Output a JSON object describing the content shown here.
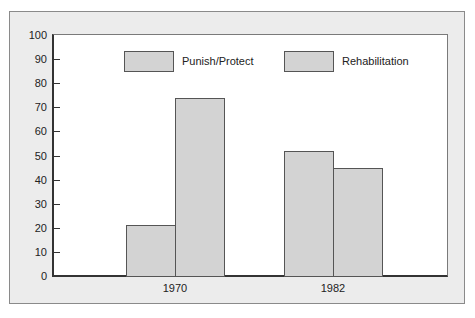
{
  "chart_data": {
    "type": "bar",
    "title": "",
    "xlabel": "",
    "ylabel": "",
    "categories": [
      "1970",
      "1982"
    ],
    "series": [
      {
        "name": "Punish/Protect",
        "values": [
          21,
          52
        ],
        "color": "#d3d3d3"
      },
      {
        "name": "Rehabilitation",
        "values": [
          74,
          45
        ],
        "color": "#d3d3d3"
      }
    ],
    "ylim": [
      0,
      100
    ],
    "yticks": [
      "0",
      "10",
      "20",
      "30",
      "40",
      "50",
      "60",
      "70",
      "80",
      "90",
      "100"
    ],
    "grid": false,
    "legend_position": "top"
  },
  "legend": {
    "item0": "Punish/Protect",
    "item1": "Rehabilitation"
  }
}
